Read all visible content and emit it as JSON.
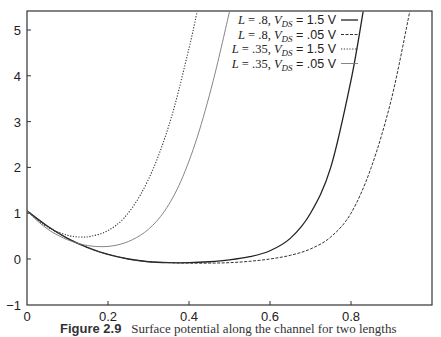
{
  "chart_data": {
    "type": "line",
    "title": "",
    "xlabel": "",
    "ylabel": "",
    "xlim": [
      0,
      1.0
    ],
    "ylim": [
      -1,
      5.4
    ],
    "x_ticks": [
      "0",
      "0.2",
      "0.4",
      "0.6",
      "0.8"
    ],
    "y_ticks": [
      "-1",
      "0",
      "1",
      "2",
      "3",
      "4",
      "5"
    ],
    "grid": false,
    "legend_position": "upper right",
    "series": [
      {
        "name": "L = .8, V_DS = 1.5 V",
        "style": "solid",
        "x": [
          0,
          0.05,
          0.1,
          0.15,
          0.2,
          0.25,
          0.3,
          0.35,
          0.4,
          0.45,
          0.5,
          0.55,
          0.6,
          0.65,
          0.7,
          0.75,
          0.8,
          0.83
        ],
        "y": [
          1.05,
          0.72,
          0.45,
          0.25,
          0.1,
          0.0,
          -0.06,
          -0.08,
          -0.08,
          -0.06,
          -0.02,
          0.05,
          0.18,
          0.45,
          1.0,
          2.0,
          3.9,
          5.4
        ]
      },
      {
        "name": "L = .8, V_DS = .05 V",
        "style": "dashed",
        "x": [
          0,
          0.05,
          0.1,
          0.15,
          0.2,
          0.25,
          0.3,
          0.35,
          0.4,
          0.45,
          0.5,
          0.55,
          0.6,
          0.65,
          0.7,
          0.75,
          0.8,
          0.85,
          0.9,
          0.945
        ],
        "y": [
          1.05,
          0.72,
          0.45,
          0.25,
          0.1,
          0.0,
          -0.06,
          -0.08,
          -0.09,
          -0.09,
          -0.08,
          -0.05,
          0.0,
          0.08,
          0.22,
          0.48,
          1.0,
          2.0,
          3.5,
          5.4
        ]
      },
      {
        "name": "L = .35, V_DS = 1.5 V",
        "style": "dotted",
        "x": [
          0,
          0.03,
          0.06,
          0.1,
          0.13,
          0.16,
          0.2,
          0.24,
          0.28,
          0.32,
          0.36,
          0.4,
          0.42
        ],
        "y": [
          1.05,
          0.82,
          0.65,
          0.52,
          0.48,
          0.5,
          0.62,
          0.9,
          1.4,
          2.15,
          3.2,
          4.6,
          5.4
        ]
      },
      {
        "name": "L = .35, V_DS = .05 V",
        "style": "thin solid",
        "x": [
          0,
          0.03,
          0.06,
          0.1,
          0.14,
          0.18,
          0.22,
          0.26,
          0.3,
          0.34,
          0.38,
          0.42,
          0.46,
          0.5
        ],
        "y": [
          1.05,
          0.8,
          0.6,
          0.42,
          0.31,
          0.27,
          0.3,
          0.42,
          0.65,
          1.05,
          1.7,
          2.65,
          3.9,
          5.4
        ]
      }
    ],
    "caption": "Figure 2.9   Surface potential along the channel for two lengths"
  },
  "legend": {
    "items": [
      {
        "pre": "L = .8, ",
        "sub": "DS",
        "post": " = 1.5 V"
      },
      {
        "pre": "L = .8, ",
        "sub": "DS",
        "post": " = .05 V"
      },
      {
        "pre": "L = .35, ",
        "sub": "DS",
        "post": " = 1.5 V"
      },
      {
        "pre": "L = .35, ",
        "sub": "DS",
        "post": " = .05 V"
      }
    ]
  },
  "caption": {
    "figure_label": "Figure 2.9",
    "text": "Surface potential along the channel for two lengths"
  }
}
